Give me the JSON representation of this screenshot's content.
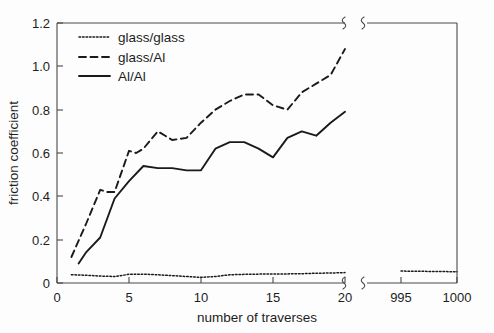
{
  "chart_data": {
    "type": "line",
    "title": "",
    "xlabel": "number of traverses",
    "ylabel": "friction coefficient",
    "xlim": [
      0,
      20
    ],
    "ylim": [
      0,
      1.2
    ],
    "grid": false,
    "legend_position": "top-left",
    "axis_break": {
      "present": true,
      "after": 20,
      "resume": 995,
      "resume_end": 1000,
      "note": "x axis broken between 20 and 995"
    },
    "xticks": [
      {
        "value": 0,
        "label": "0"
      },
      {
        "value": 5,
        "label": "5"
      },
      {
        "value": 10,
        "label": "10"
      },
      {
        "value": 15,
        "label": "15"
      },
      {
        "value": 20,
        "label": "20"
      },
      {
        "value": 995,
        "label": "995"
      },
      {
        "value": 1000,
        "label": "1000"
      }
    ],
    "yticks": [
      {
        "value": 0,
        "label": "0"
      },
      {
        "value": 0.2,
        "label": "0.2"
      },
      {
        "value": 0.4,
        "label": "0.4"
      },
      {
        "value": 0.6,
        "label": "0.6"
      },
      {
        "value": 0.8,
        "label": "0.8"
      },
      {
        "value": 1.0,
        "label": "1.0"
      },
      {
        "value": 1.2,
        "label": "1.2"
      }
    ],
    "series": [
      {
        "name": "glass/glass",
        "style": "dotted",
        "color": "#1a1a1a",
        "x": [
          1,
          2,
          3,
          4,
          5,
          6,
          7,
          8,
          9,
          10,
          11,
          12,
          13,
          14,
          15,
          16,
          17,
          18,
          19,
          20
        ],
        "values": [
          0.038,
          0.036,
          0.032,
          0.03,
          0.04,
          0.041,
          0.038,
          0.034,
          0.03,
          0.026,
          0.03,
          0.038,
          0.04,
          0.041,
          0.041,
          0.042,
          0.043,
          0.045,
          0.046,
          0.048
        ],
        "x_after_break": [
          995,
          1000
        ],
        "values_after_break": [
          0.055,
          0.052
        ]
      },
      {
        "name": "glass/Al",
        "style": "dashed",
        "color": "#1a1a1a",
        "x": [
          1,
          2,
          3,
          3.5,
          4,
          5,
          5.5,
          6,
          7,
          8,
          9,
          10,
          11,
          12,
          13,
          14,
          15,
          16,
          17,
          18,
          19,
          20
        ],
        "values": [
          0.12,
          0.27,
          0.43,
          0.42,
          0.42,
          0.61,
          0.6,
          0.62,
          0.7,
          0.66,
          0.67,
          0.74,
          0.8,
          0.84,
          0.87,
          0.87,
          0.82,
          0.8,
          0.88,
          0.92,
          0.96,
          1.08
        ]
      },
      {
        "name": "Al/Al",
        "style": "solid",
        "color": "#1a1a1a",
        "x": [
          1.5,
          2,
          3,
          4,
          5,
          6,
          7,
          8,
          9,
          10,
          11,
          12,
          13,
          14,
          15,
          16,
          17,
          18,
          19,
          20
        ],
        "values": [
          0.09,
          0.14,
          0.21,
          0.39,
          0.47,
          0.54,
          0.53,
          0.53,
          0.52,
          0.52,
          0.62,
          0.65,
          0.65,
          0.62,
          0.58,
          0.67,
          0.7,
          0.68,
          0.74,
          0.79
        ]
      }
    ]
  },
  "legend": {
    "items": [
      {
        "label": "glass/glass",
        "style": "dotted"
      },
      {
        "label": "glass/Al",
        "style": "dashed"
      },
      {
        "label": "Al/Al",
        "style": "solid"
      }
    ]
  },
  "axes": {
    "x_title": "number of traverses",
    "y_title": "friction coefficient"
  }
}
